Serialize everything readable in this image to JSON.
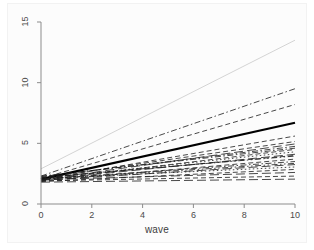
{
  "chart_data": {
    "type": "line",
    "title": "",
    "subtitle": "",
    "xlabel": "wave",
    "ylabel": "",
    "xlim": [
      0,
      10
    ],
    "ylim": [
      0,
      15
    ],
    "xticks": [
      0,
      2,
      4,
      6,
      8,
      10
    ],
    "yticks": [
      0,
      5,
      10,
      15
    ],
    "xtick_labels": [
      "0",
      "2",
      "4",
      "6",
      "8",
      "10"
    ],
    "ytick_labels": [
      "0",
      "5",
      "10",
      "15"
    ],
    "grid": false,
    "legend": "none",
    "x": [
      0,
      10
    ],
    "series": [
      {
        "name": "subject-01",
        "values": [
          2.9,
          13.5
        ],
        "style": "solid",
        "color": "#c9c9c9",
        "width": 0.8
      },
      {
        "name": "subject-02",
        "values": [
          2.3,
          9.5
        ],
        "style": "dashdot",
        "color": "#1a1a1a",
        "width": 0.8
      },
      {
        "name": "subject-03",
        "values": [
          2.1,
          8.2
        ],
        "style": "dashed",
        "color": "#1a1a1a",
        "width": 0.8
      },
      {
        "name": "average",
        "values": [
          2.05,
          6.7
        ],
        "style": "solid",
        "color": "#000000",
        "width": 2.2
      },
      {
        "name": "subject-04",
        "values": [
          2.0,
          5.6
        ],
        "style": "dashed",
        "color": "#1a1a1a",
        "width": 0.8
      },
      {
        "name": "subject-05",
        "values": [
          2.15,
          5.15
        ],
        "style": "dashed",
        "color": "#1a1a1a",
        "width": 0.8
      },
      {
        "name": "subject-06",
        "values": [
          2.0,
          4.95
        ],
        "style": "longdash",
        "color": "#1a1a1a",
        "width": 0.8
      },
      {
        "name": "subject-07",
        "values": [
          2.25,
          4.75
        ],
        "style": "dashdot",
        "color": "#1a1a1a",
        "width": 0.8
      },
      {
        "name": "subject-08",
        "values": [
          1.95,
          4.5
        ],
        "style": "dashed",
        "color": "#1a1a1a",
        "width": 0.8
      },
      {
        "name": "subject-09",
        "values": [
          2.1,
          4.3
        ],
        "style": "dotted",
        "color": "#1a1a1a",
        "width": 0.8
      },
      {
        "name": "subject-10",
        "values": [
          2.0,
          4.1
        ],
        "style": "longdash",
        "color": "#1a1a1a",
        "width": 0.8
      },
      {
        "name": "subject-11",
        "values": [
          2.2,
          3.95
        ],
        "style": "dashdotdot",
        "color": "#1a1a1a",
        "width": 0.8
      },
      {
        "name": "subject-12",
        "values": [
          1.9,
          3.7
        ],
        "style": "dashed",
        "color": "#1a1a1a",
        "width": 0.8
      },
      {
        "name": "subject-13",
        "values": [
          2.05,
          3.5
        ],
        "style": "dashdot",
        "color": "#1a1a1a",
        "width": 0.8
      },
      {
        "name": "subject-14",
        "values": [
          1.95,
          3.25
        ],
        "style": "longdash",
        "color": "#1a1a1a",
        "width": 0.8
      },
      {
        "name": "subject-15",
        "values": [
          2.1,
          3.05
        ],
        "style": "dotted",
        "color": "#1a1a1a",
        "width": 0.8
      },
      {
        "name": "subject-16",
        "values": [
          1.85,
          2.85
        ],
        "style": "dashed",
        "color": "#1a1a1a",
        "width": 0.8
      },
      {
        "name": "subject-17",
        "values": [
          2.0,
          2.6
        ],
        "style": "longdash",
        "color": "#1a1a1a",
        "width": 0.8
      },
      {
        "name": "subject-18",
        "values": [
          1.9,
          2.3
        ],
        "style": "dashed",
        "color": "#1a1a1a",
        "width": 0.8
      },
      {
        "name": "subject-19",
        "values": [
          1.8,
          2.05
        ],
        "style": "longdash",
        "color": "#1a1a1a",
        "width": 0.8
      },
      {
        "name": "subject-20",
        "values": [
          2.3,
          4.6
        ],
        "style": "dashdot",
        "color": "#1a1a1a",
        "width": 0.8
      },
      {
        "name": "subject-21",
        "values": [
          2.15,
          4.0
        ],
        "style": "dashed",
        "color": "#1a1a1a",
        "width": 0.8
      },
      {
        "name": "subject-22",
        "values": [
          2.05,
          3.35
        ],
        "style": "dashdotdot",
        "color": "#1a1a1a",
        "width": 0.8
      }
    ]
  },
  "axes": {
    "x_title": "wave",
    "y_title": ""
  }
}
